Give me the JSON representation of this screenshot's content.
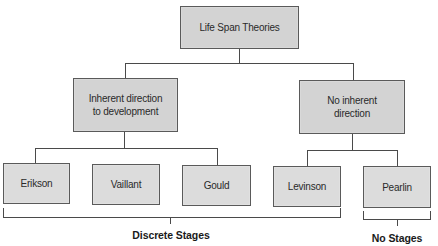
{
  "diagram": {
    "root": {
      "label": "Life Span Theories"
    },
    "branches": [
      {
        "label": "Inherent direction\nto development",
        "children": [
          {
            "label": "Erikson"
          },
          {
            "label": "Vaillant"
          },
          {
            "label": "Gould"
          }
        ]
      },
      {
        "label": "No inherent\ndirection",
        "children": [
          {
            "label": "Levinson"
          },
          {
            "label": "Pearlin"
          }
        ]
      }
    ],
    "groupings": [
      {
        "label": "Discrete Stages",
        "spans": [
          "Erikson",
          "Vaillant",
          "Gould",
          "Levinson"
        ]
      },
      {
        "label": "No Stages",
        "spans": [
          "Pearlin"
        ]
      }
    ]
  },
  "colors": {
    "box_fill": "#d3d3d3",
    "box_border": "#5a5a5a",
    "line": "#4a4a4a",
    "text": "#2a2a2a"
  }
}
